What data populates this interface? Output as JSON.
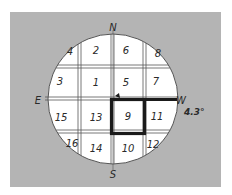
{
  "diagram": {
    "type": "compass-grid",
    "compass": {
      "north": "N",
      "south": "S",
      "east": "E",
      "west": "W"
    },
    "angle_label": "4.3°",
    "cells": [
      {
        "id": "c4",
        "label": "4",
        "x": 70,
        "y": 55
      },
      {
        "id": "c2",
        "label": "2",
        "x": 96,
        "y": 54
      },
      {
        "id": "c6",
        "label": "6",
        "x": 126,
        "y": 54
      },
      {
        "id": "c8",
        "label": "8",
        "x": 158,
        "y": 57
      },
      {
        "id": "c3",
        "label": "3",
        "x": 60,
        "y": 85
      },
      {
        "id": "c1",
        "label": "1",
        "x": 96,
        "y": 86
      },
      {
        "id": "c5",
        "label": "5",
        "x": 126,
        "y": 86
      },
      {
        "id": "c7",
        "label": "7",
        "x": 156,
        "y": 85
      },
      {
        "id": "c15",
        "label": "15",
        "x": 61,
        "y": 121
      },
      {
        "id": "c13",
        "label": "13",
        "x": 96,
        "y": 121
      },
      {
        "id": "c9",
        "label": "9",
        "x": 128,
        "y": 120
      },
      {
        "id": "c11",
        "label": "11",
        "x": 157,
        "y": 120
      },
      {
        "id": "c16",
        "label": "16",
        "x": 72,
        "y": 147
      },
      {
        "id": "c14",
        "label": "14",
        "x": 96,
        "y": 152
      },
      {
        "id": "c10",
        "label": "10",
        "x": 128,
        "y": 152
      },
      {
        "id": "c12",
        "label": "12",
        "x": 153,
        "y": 148
      }
    ],
    "highlighted_cell": "9",
    "colors": {
      "background": "#b4b4b4",
      "circle": "#ffffff",
      "lines": "#3a3a3a",
      "highlight": "#1a1a1a"
    }
  }
}
